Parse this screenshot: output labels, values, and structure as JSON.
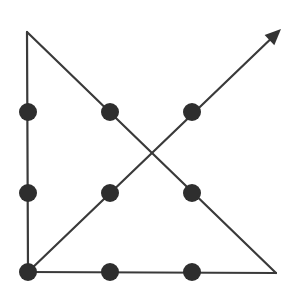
{
  "diagram": {
    "type": "nine-dot-puzzle-solution",
    "colors": {
      "line": "#3a3a3a",
      "dot": "#2e2e2e",
      "background": "#ffffff"
    },
    "dots": [
      {
        "row": 1,
        "col": 1,
        "x": 28,
        "y": 112
      },
      {
        "row": 1,
        "col": 2,
        "x": 110,
        "y": 112
      },
      {
        "row": 1,
        "col": 3,
        "x": 192,
        "y": 112
      },
      {
        "row": 2,
        "col": 1,
        "x": 28,
        "y": 193
      },
      {
        "row": 2,
        "col": 2,
        "x": 110,
        "y": 193
      },
      {
        "row": 2,
        "col": 3,
        "x": 192,
        "y": 193
      },
      {
        "row": 3,
        "col": 1,
        "x": 28,
        "y": 272
      },
      {
        "row": 3,
        "col": 2,
        "x": 110,
        "y": 272
      },
      {
        "row": 3,
        "col": 3,
        "x": 192,
        "y": 272
      }
    ],
    "path": [
      {
        "x": 28,
        "y": 272
      },
      {
        "x": 27,
        "y": 32
      },
      {
        "x": 276,
        "y": 273
      },
      {
        "x": 28,
        "y": 272
      },
      {
        "x": 281,
        "y": 29
      }
    ],
    "segments_count": 4,
    "arrow": {
      "direction": "up-right",
      "tip": {
        "x": 281,
        "y": 29
      }
    }
  }
}
